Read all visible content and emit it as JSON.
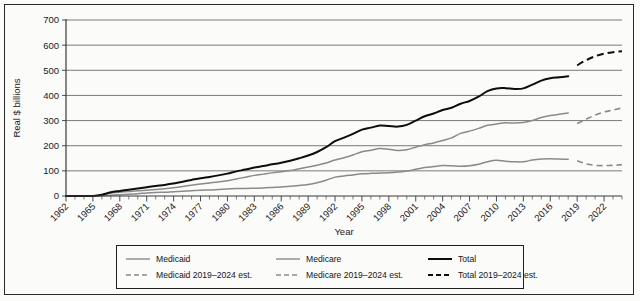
{
  "chart_data": {
    "type": "line",
    "title": "",
    "xlabel": "Year",
    "ylabel": "Real $ billions",
    "ylim": [
      0,
      700
    ],
    "yticks": [
      0,
      100,
      200,
      300,
      400,
      500,
      600,
      700
    ],
    "xlim": [
      1962,
      2024
    ],
    "xticks": [
      1962,
      1965,
      1968,
      1971,
      1974,
      1977,
      1980,
      1983,
      1986,
      1989,
      1992,
      1995,
      1998,
      2001,
      2004,
      2007,
      2010,
      2013,
      2016,
      2019,
      2022
    ],
    "grid": "horizontal",
    "legend_position": "bottom",
    "series": [
      {
        "name": "Medicaid",
        "style": "solid",
        "color": "#8a8a8a",
        "x": [
          1962,
          1963,
          1964,
          1965,
          1966,
          1967,
          1968,
          1969,
          1970,
          1971,
          1972,
          1973,
          1974,
          1975,
          1976,
          1977,
          1978,
          1979,
          1980,
          1981,
          1982,
          1983,
          1984,
          1985,
          1986,
          1987,
          1988,
          1989,
          1990,
          1991,
          1992,
          1993,
          1994,
          1995,
          1996,
          1997,
          1998,
          1999,
          2000,
          2001,
          2002,
          2003,
          2004,
          2005,
          2006,
          2007,
          2008,
          2009,
          2010,
          2011,
          2012,
          2013,
          2014,
          2015,
          2016,
          2017,
          2018
        ],
        "values": [
          0,
          0,
          0,
          0,
          1,
          3,
          5,
          7,
          9,
          12,
          14,
          15,
          17,
          19,
          21,
          23,
          24,
          26,
          28,
          30,
          30,
          31,
          32,
          34,
          36,
          39,
          42,
          46,
          53,
          63,
          75,
          80,
          84,
          88,
          90,
          91,
          92,
          95,
          99,
          106,
          113,
          117,
          121,
          120,
          118,
          120,
          126,
          136,
          142,
          138,
          136,
          136,
          143,
          147,
          148,
          147,
          146
        ]
      },
      {
        "name": "Medicare",
        "style": "solid",
        "color": "#8a8a8a",
        "x": [
          1962,
          1963,
          1964,
          1965,
          1966,
          1967,
          1968,
          1969,
          1970,
          1971,
          1972,
          1973,
          1974,
          1975,
          1976,
          1977,
          1978,
          1979,
          1980,
          1981,
          1982,
          1983,
          1984,
          1985,
          1986,
          1987,
          1988,
          1989,
          1990,
          1991,
          1992,
          1993,
          1994,
          1995,
          1996,
          1997,
          1998,
          1999,
          2000,
          2001,
          2002,
          2003,
          2004,
          2005,
          2006,
          2007,
          2008,
          2009,
          2010,
          2011,
          2012,
          2013,
          2014,
          2015,
          2016,
          2017,
          2018
        ],
        "values": [
          0,
          0,
          0,
          0,
          4,
          12,
          15,
          18,
          21,
          23,
          26,
          29,
          33,
          38,
          43,
          48,
          52,
          56,
          61,
          68,
          75,
          82,
          87,
          92,
          96,
          101,
          108,
          115,
          122,
          131,
          143,
          152,
          163,
          176,
          182,
          189,
          186,
          181,
          184,
          194,
          204,
          211,
          221,
          231,
          249,
          258,
          269,
          281,
          286,
          291,
          290,
          292,
          300,
          312,
          320,
          325,
          330
        ]
      },
      {
        "name": "Total",
        "style": "solid",
        "color": "#0d0d0d",
        "x": [
          1962,
          1963,
          1964,
          1965,
          1966,
          1967,
          1968,
          1969,
          1970,
          1971,
          1972,
          1973,
          1974,
          1975,
          1976,
          1977,
          1978,
          1979,
          1980,
          1981,
          1982,
          1983,
          1984,
          1985,
          1986,
          1987,
          1988,
          1989,
          1990,
          1991,
          1992,
          1993,
          1994,
          1995,
          1996,
          1997,
          1998,
          1999,
          2000,
          2001,
          2002,
          2003,
          2004,
          2005,
          2006,
          2007,
          2008,
          2009,
          2010,
          2011,
          2012,
          2013,
          2014,
          2015,
          2016,
          2017,
          2018
        ],
        "values": [
          0,
          0,
          0,
          0,
          5,
          15,
          20,
          25,
          30,
          35,
          40,
          44,
          50,
          57,
          64,
          71,
          76,
          82,
          89,
          98,
          105,
          113,
          119,
          126,
          132,
          140,
          150,
          161,
          175,
          194,
          218,
          232,
          247,
          264,
          272,
          280,
          278,
          276,
          283,
          300,
          317,
          328,
          342,
          351,
          367,
          378,
          395,
          417,
          428,
          429,
          426,
          428,
          443,
          459,
          468,
          472,
          476
        ]
      },
      {
        "name": "Medicaid 2019–2024 est.",
        "style": "dashed",
        "color": "#8a8a8a",
        "x": [
          2019,
          2020,
          2021,
          2022,
          2023,
          2024
        ],
        "values": [
          140,
          128,
          122,
          121,
          122,
          124
        ]
      },
      {
        "name": "Medicare 2019–2024 est.",
        "style": "dashed",
        "color": "#8a8a8a",
        "x": [
          2019,
          2020,
          2021,
          2022,
          2023,
          2024
        ],
        "values": [
          288,
          305,
          322,
          334,
          342,
          350
        ]
      },
      {
        "name": "Total 2019–2024 est.",
        "style": "dashed",
        "color": "#0d0d0d",
        "x": [
          2019,
          2020,
          2021,
          2022,
          2023,
          2024
        ],
        "values": [
          520,
          540,
          556,
          566,
          572,
          576
        ]
      }
    ]
  },
  "axes": {
    "ylabel": "Real $ billions",
    "xlabel": "Year"
  },
  "legend": {
    "items": [
      {
        "label": "Medicaid",
        "style": "solid",
        "color": "#8a8a8a",
        "weight": "thin"
      },
      {
        "label": "Medicare",
        "style": "solid",
        "color": "#8a8a8a",
        "weight": "thin"
      },
      {
        "label": "Total",
        "style": "solid",
        "color": "#0d0d0d",
        "weight": "thick"
      },
      {
        "label": "Medicaid 2019–2024 est.",
        "style": "dashed",
        "color": "#8a8a8a",
        "weight": "thin"
      },
      {
        "label": "Medicare 2019–2024 est.",
        "style": "dashed",
        "color": "#8a8a8a",
        "weight": "thin"
      },
      {
        "label": "Total 2019–2024 est.",
        "style": "dashed",
        "color": "#0d0d0d",
        "weight": "thick"
      }
    ]
  }
}
